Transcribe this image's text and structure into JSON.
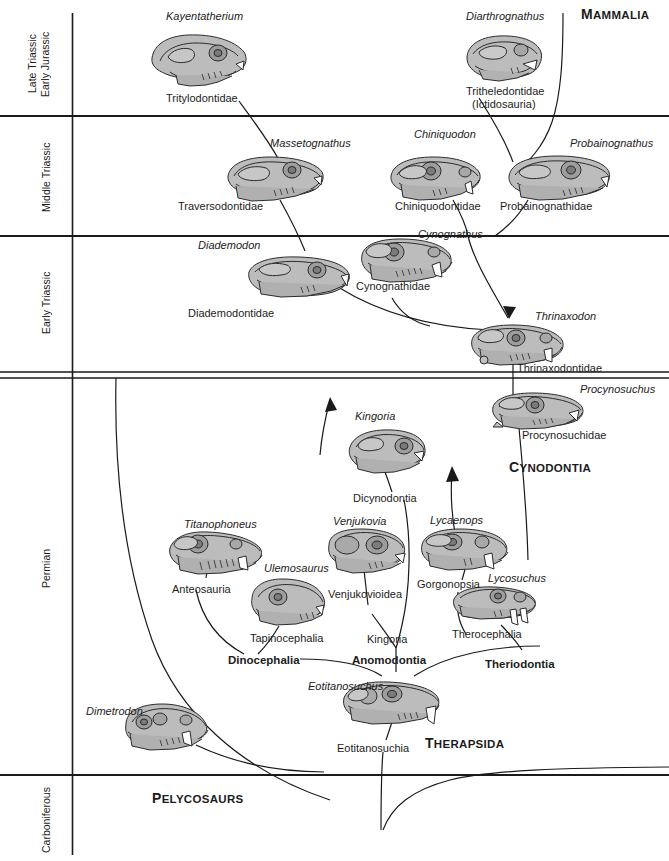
{
  "diagram": {
    "type": "evolutionary-tree-stratigraphic-chart",
    "colors": {
      "skull_fill": "#b9b9b9",
      "skull_fill_light": "#cdcdcd",
      "outline": "#2b2b2b",
      "axis": "#1a1a1a",
      "text": "#1c1c1c"
    }
  },
  "time_axis": {
    "label": "Geologic time (youngest at top)",
    "periods": [
      {
        "id": "late-triassic-early-jurassic",
        "label": "Late Triassic\nEarly Jurassic",
        "line1": "Late Triassic",
        "line2": "Early Jurassic",
        "top": 13,
        "bottom": 116
      },
      {
        "id": "middle-triassic",
        "label": "Middle Triassic",
        "line1": "Middle Triassic",
        "line2": "",
        "top": 116,
        "bottom": 236
      },
      {
        "id": "early-triassic",
        "label": "Early Triassic",
        "line1": "Early Triassic",
        "line2": "",
        "top": 236,
        "bottom": 372
      },
      {
        "id": "permian",
        "label": "Permian",
        "line1": "Permian",
        "line2": "",
        "top": 378,
        "bottom": 775
      },
      {
        "id": "carboniferous",
        "label": "Carboniferous",
        "line1": "Carboniferous",
        "line2": "",
        "top": 775,
        "bottom": 855
      }
    ],
    "boundaries": [
      {
        "y": 116,
        "style": "single"
      },
      {
        "y": 236,
        "style": "single"
      },
      {
        "y": 372,
        "style": "double"
      },
      {
        "y": 775,
        "style": "single"
      }
    ]
  },
  "taxa": [
    {
      "id": "kayentatherium",
      "genus": "Kayentatherium",
      "family": "Tritylodontidae",
      "period": "late-triassic-early-jurassic"
    },
    {
      "id": "diarthrognathus",
      "genus": "Diarthrognathus",
      "family": "Tritheledontidae",
      "family_alt": "(Ictidosauria)",
      "period": "late-triassic-early-jurassic"
    },
    {
      "id": "massetognathus",
      "genus": "Massetognathus",
      "family": "Traversodontidae",
      "period": "middle-triassic"
    },
    {
      "id": "chiniquodon",
      "genus": "Chiniquodon",
      "family": "Chiniquodontidae",
      "period": "middle-triassic"
    },
    {
      "id": "probainognathus",
      "genus": "Probainognathus",
      "family": "Probainognathidae",
      "period": "middle-triassic"
    },
    {
      "id": "diademodon",
      "genus": "Diademodon",
      "family": "Diademodontidae",
      "period": "early-triassic"
    },
    {
      "id": "cynognathus",
      "genus": "Cynognathus",
      "family": "Cynognathidae",
      "period": "early-triassic"
    },
    {
      "id": "thrinaxodon",
      "genus": "Thrinaxodon",
      "family": "Thrinaxodontidae",
      "period": "early-triassic"
    },
    {
      "id": "procynosuchus",
      "genus": "Procynosuchus",
      "family": "Procynosuchidae",
      "period": "permian"
    },
    {
      "id": "kingoria",
      "genus": "Kingoria",
      "family": "Dicynodontia",
      "period": "permian"
    },
    {
      "id": "titanophoneus",
      "genus": "Titanophoneus",
      "family": "Anteosauria",
      "period": "permian"
    },
    {
      "id": "ulemosaurus",
      "genus": "Ulemosaurus",
      "family": "Tapinocephalia",
      "period": "permian"
    },
    {
      "id": "venjukovia",
      "genus": "Venjukovia",
      "family": "Venjukovioidea",
      "period": "permian"
    },
    {
      "id": "lycaenops",
      "genus": "Lycaenops",
      "family": "Gorgonopsia",
      "period": "permian"
    },
    {
      "id": "lycosuchus",
      "genus": "Lycosuchus",
      "family": "Therocephalia",
      "period": "permian"
    },
    {
      "id": "eotitanosuchus",
      "genus": "Eotitanosuchus",
      "family": "Eotitanosuchia",
      "period": "permian"
    },
    {
      "id": "dimetrodon",
      "genus": "Dimetrodon",
      "family": "",
      "period": "permian"
    }
  ],
  "labels": {
    "kayentatherium_genus": "Kayentatherium",
    "tritylodontidae": "Tritylodontidae",
    "diarthrognathus_genus": "Diarthrognathus",
    "tritheledontidae": "Tritheledontidae",
    "ictidosauria": "(Ictidosauria)",
    "mammalia": "MAMMALIA",
    "massetognathus_genus": "Massetognathus",
    "traversodontidae": "Traversodontidae",
    "chiniquodon_genus": "Chiniquodon",
    "chiniquodontidae": "Chiniquodontidae",
    "probainognathus_genus": "Probainognathus",
    "probainognathidae": "Probainognathidae",
    "diademodon_genus": "Diademodon",
    "diademodontidae": "Diademodontidae",
    "cynognathus_genus": "Cynognathus",
    "cynognathidae": "Cynognathidae",
    "thrinaxodon_genus": "Thrinaxodon",
    "thrinaxodontidae": "Thrinaxodontidae",
    "procynosuchus_genus": "Procynosuchus",
    "procynosuchidae": "Procynosuchidae",
    "cynodontia": "CYNODONTIA",
    "kingoria_genus": "Kingoria",
    "dicynodontia": "Dicynodontia",
    "titanophoneus_genus": "Titanophoneus",
    "anteosauria": "Anteosauria",
    "ulemosaurus_genus": "Ulemosaurus",
    "tapinocephalia": "Tapinocephalia",
    "venjukovia_genus": "Venjukovia",
    "venjukovioidea": "Venjukovioidea",
    "lycaenops_genus": "Lycaenops",
    "gorgonopsia": "Gorgonopsia",
    "lycosuchus_genus": "Lycosuchus",
    "therocephalia": "Therocephalia",
    "dinocephalia": "Dinocephalia",
    "kingoria_clade": "Kingoria",
    "anomodontia": "Anomodontia",
    "theriodontia": "Theriodontia",
    "eotitanosuchus_genus": "Eotitanosuchus",
    "eotitanosuchia": "Eotitanosuchia",
    "therapsida": "THERAPSIDA",
    "dimetrodon_genus": "Dimetrodon",
    "pelycosaurs": "PELYCOSAURS"
  },
  "clade_labels": [
    {
      "id": "mammalia",
      "text": "MAMMALIA",
      "style": "small-caps-bold"
    },
    {
      "id": "cynodontia",
      "text": "CYNODONTIA",
      "style": "small-caps-bold",
      "has_arrow": true
    },
    {
      "id": "therapsida",
      "text": "THERAPSIDA",
      "style": "small-caps-bold"
    },
    {
      "id": "pelycosaurs",
      "text": "PELYCOSAURS",
      "style": "small-caps-bold"
    },
    {
      "id": "dinocephalia",
      "text": "Dinocephalia",
      "style": "bold"
    },
    {
      "id": "anomodontia",
      "text": "Anomodontia",
      "style": "bold"
    },
    {
      "id": "theriodontia",
      "text": "Theriodontia",
      "style": "bold"
    }
  ]
}
